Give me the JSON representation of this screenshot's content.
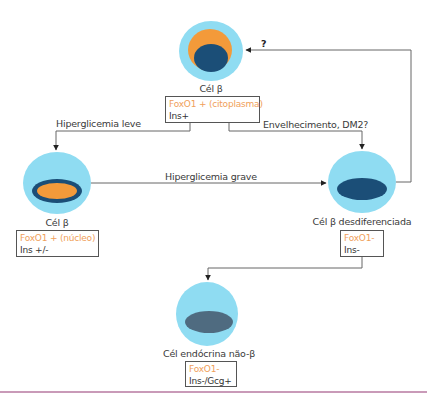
{
  "colors": {
    "cell_cytoplasm": "#8fdcf2",
    "orange": "#f39a3a",
    "nucleus_dark": "#1b4e77",
    "nucleus_gray": "#4f6b80",
    "foxo_text": "#f0a05a",
    "line": "#555555",
    "bottom_rule": "#c99ab8"
  },
  "cells": {
    "top": {
      "label": "Cél β",
      "foxo": "FoxO1 + (citoplasma)",
      "ins": "Ins+"
    },
    "left": {
      "label": "Cél β",
      "foxo": "FoxO1 + (núcleo)",
      "ins": "Ins +/-"
    },
    "right": {
      "label": "Cél β desdiferenciada",
      "foxo": "FoxO1-",
      "ins": "Ins-"
    },
    "bottom": {
      "label": "Cél endócrina não-β",
      "foxo": "FoxO1-",
      "ins": "Ins-/Gcg+"
    }
  },
  "edges": {
    "top_to_left": "Hiperglicemia leve",
    "top_to_right": "Envelhecimento, DM2?",
    "left_to_right": "Hiperglicemia grave",
    "right_to_top": "?"
  }
}
